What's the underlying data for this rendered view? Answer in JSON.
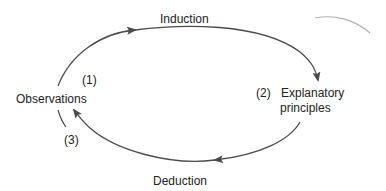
{
  "diagram": {
    "title": "",
    "nodes": {
      "observations": "Observations",
      "explanatory_line1": "Explanatory",
      "explanatory_line2": "principles"
    },
    "edges": {
      "induction": "Induction",
      "deduction": "Deduction"
    },
    "steps": {
      "step1": "(1)",
      "step2": "(2)",
      "step3": "(3)"
    },
    "colors": {
      "stroke": "#4a4a4a",
      "text": "#222222",
      "faint_stroke": "#b0b0b0"
    }
  }
}
